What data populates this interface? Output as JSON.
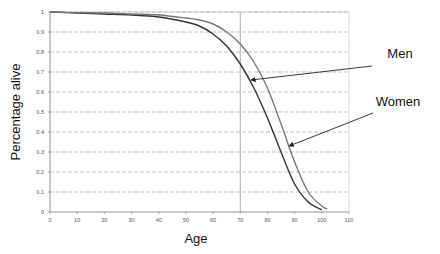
{
  "chart_data": {
    "type": "line",
    "title": "",
    "xlabel": "Age",
    "ylabel": "Percentage alive",
    "xlim": [
      0,
      110
    ],
    "ylim": [
      0,
      1
    ],
    "xticks": [
      0,
      10,
      20,
      30,
      40,
      50,
      60,
      70,
      80,
      90,
      100,
      110
    ],
    "yticks": [
      0,
      0.1,
      0.2,
      0.3,
      0.4,
      0.5,
      0.6,
      0.7,
      0.8,
      0.9,
      1
    ],
    "xtick_labels": [
      "0",
      "10",
      "20",
      "30",
      "40",
      "50",
      "60",
      "70",
      "80",
      "90",
      "100",
      "110"
    ],
    "ytick_labels": [
      "0",
      "0.1",
      "0.2",
      "0.3",
      "0.4",
      "0.5",
      "0.6",
      "0.7",
      "0.8",
      "0.9",
      "1"
    ],
    "grid": {
      "horizontal": true,
      "style": "dashed"
    },
    "reference_line": {
      "axis": "x",
      "value": 70
    },
    "series": [
      {
        "name": "Men",
        "color": "#333333",
        "x": [
          0,
          10,
          20,
          30,
          40,
          50,
          55,
          60,
          65,
          70,
          75,
          80,
          85,
          90,
          95,
          100
        ],
        "values": [
          1.0,
          0.995,
          0.99,
          0.985,
          0.975,
          0.95,
          0.93,
          0.89,
          0.83,
          0.74,
          0.62,
          0.47,
          0.3,
          0.14,
          0.05,
          0.01
        ]
      },
      {
        "name": "Women",
        "color": "#777777",
        "x": [
          0,
          10,
          20,
          30,
          40,
          50,
          55,
          60,
          65,
          70,
          75,
          80,
          85,
          90,
          95,
          100,
          102
        ],
        "values": [
          1.0,
          0.997,
          0.995,
          0.99,
          0.985,
          0.97,
          0.96,
          0.94,
          0.9,
          0.84,
          0.75,
          0.62,
          0.44,
          0.25,
          0.1,
          0.03,
          0.015
        ]
      }
    ],
    "annotations": [
      {
        "text": "Men",
        "arrow_to_series": "Men",
        "arrow_target": [
          74,
          0.66
        ]
      },
      {
        "text": "Women",
        "arrow_to_series": "Women",
        "arrow_target": [
          88,
          0.33
        ]
      }
    ],
    "legend": "none (inline annotations with arrows)"
  }
}
